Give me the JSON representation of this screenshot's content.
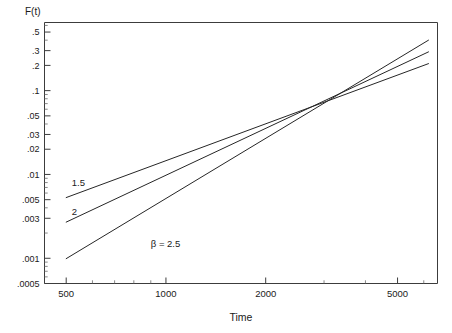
{
  "chart_data": {
    "type": "line",
    "title": "",
    "xlabel": "Time",
    "ylabel": "F(t)",
    "xscale": "log",
    "yscale": "log",
    "xlim": [
      430,
      6600
    ],
    "ylim": [
      0.0005,
      0.65
    ],
    "grid": false,
    "legend_position": "inline-annotations",
    "x_ticks": [
      500,
      1000,
      2000,
      5000
    ],
    "x_tick_labels": [
      "500",
      "1000",
      "2000",
      "5000"
    ],
    "y_ticks": [
      0.5,
      0.3,
      0.2,
      0.1,
      0.05,
      0.03,
      0.02,
      0.01,
      0.005,
      0.003,
      0.001,
      0.0005
    ],
    "y_tick_labels": [
      ".5",
      ".3",
      ".2",
      ".1",
      ".05",
      ".03",
      ".02",
      ".01",
      ".005",
      ".003",
      ".001",
      ".0005"
    ],
    "series": [
      {
        "name": "1.5",
        "label": "1.5",
        "beta": 1.5,
        "x": [
          500,
          6200
        ],
        "y": [
          0.0053,
          0.21
        ],
        "label_x": 520,
        "label_y": 0.0072
      },
      {
        "name": "2",
        "label": "2",
        "beta": 2.0,
        "x": [
          500,
          6200
        ],
        "y": [
          0.0027,
          0.29
        ],
        "label_x": 520,
        "label_y": 0.0033
      },
      {
        "name": "beta = 2.5",
        "label": "β = 2.5",
        "beta": 2.5,
        "x": [
          500,
          6200
        ],
        "y": [
          0.00099,
          0.4
        ],
        "label_x": 900,
        "label_y": 0.00135
      }
    ],
    "annotations": [
      {
        "text": "1.5",
        "x": 520,
        "y": 0.0072
      },
      {
        "text": "2",
        "x": 520,
        "y": 0.0033
      },
      {
        "text": "β = 2.5",
        "x": 900,
        "y": 0.00135
      }
    ]
  },
  "axes": {
    "y_axis_caption": "F(t)",
    "x_axis_caption": "Time"
  },
  "colors": {
    "line": "#262626",
    "frame": "#3c3c3c",
    "text": "#1a1a1a",
    "background": "#ffffff"
  }
}
